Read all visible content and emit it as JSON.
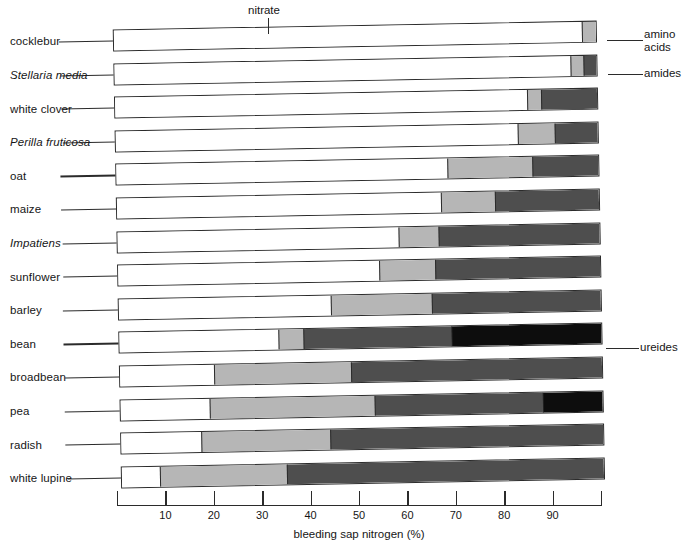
{
  "chart_data": {
    "type": "bar",
    "orientation": "horizontal",
    "stacked": true,
    "title": "",
    "xlabel": "bleeding sap nitrogen (%)",
    "ylabel": "",
    "xlim": [
      0,
      100
    ],
    "xticks": [
      0,
      10,
      20,
      30,
      40,
      50,
      60,
      70,
      80,
      90,
      100
    ],
    "xtick_labels": [
      "",
      "10",
      "20",
      "30",
      "40",
      "50",
      "60",
      "70",
      "80",
      "90",
      ""
    ],
    "grid": false,
    "legend": "callout-annotations",
    "series": [
      {
        "name": "nitrate",
        "color": "#ffffff"
      },
      {
        "name": "amino acids",
        "color": "#b6b6b6"
      },
      {
        "name": "amides",
        "color": "#4e4e4e"
      },
      {
        "name": "ureides",
        "color": "#0d0d0d"
      }
    ],
    "categories": [
      "cocklebur",
      "Stellaria media",
      "white clover",
      "Perilla fruticosa",
      "oat",
      "maize",
      "Impatiens",
      "sunflower",
      "barley",
      "bean",
      "broadbean",
      "pea",
      "radish",
      "white lupine"
    ],
    "values": {
      "nitrate": [
        97.0,
        94.6,
        85.5,
        83.3,
        68.6,
        67.2,
        58.3,
        54.1,
        44.0,
        33.0,
        19.4,
        18.4,
        16.7,
        7.9
      ],
      "amino acids": [
        3.0,
        2.7,
        2.9,
        7.7,
        17.8,
        11.3,
        8.2,
        11.6,
        20.9,
        5.2,
        28.6,
        34.3,
        26.7,
        26.4
      ],
      "amides": [
        0.0,
        2.7,
        11.6,
        9.0,
        13.6,
        21.5,
        33.5,
        34.3,
        35.1,
        30.6,
        52.0,
        34.9,
        56.6,
        65.7
      ],
      "ureides": [
        0.0,
        0.0,
        0.0,
        0.0,
        0.0,
        0.0,
        0.0,
        0.0,
        0.0,
        31.2,
        0.0,
        12.4,
        0.0,
        0.0
      ]
    },
    "rows": [
      {
        "label": "cocklebur",
        "italic": false,
        "segments": [
          97.0,
          3.0,
          0.0,
          0.0
        ]
      },
      {
        "label": "Stellaria media",
        "italic": true,
        "segments": [
          94.6,
          2.7,
          2.7,
          0.0
        ]
      },
      {
        "label": "white clover",
        "italic": false,
        "segments": [
          85.5,
          2.9,
          11.6,
          0.0
        ]
      },
      {
        "label": "Perilla fruticosa",
        "italic": true,
        "segments": [
          83.3,
          7.7,
          9.0,
          0.0
        ]
      },
      {
        "label": "oat",
        "italic": false,
        "segments": [
          68.6,
          17.8,
          13.6,
          0.0
        ]
      },
      {
        "label": "maize",
        "italic": false,
        "segments": [
          67.2,
          11.3,
          21.5,
          0.0
        ]
      },
      {
        "label": "Impatiens",
        "italic": true,
        "segments": [
          58.3,
          8.2,
          33.5,
          0.0
        ]
      },
      {
        "label": "sunflower",
        "italic": false,
        "segments": [
          54.1,
          11.6,
          34.3,
          0.0
        ]
      },
      {
        "label": "barley",
        "italic": false,
        "segments": [
          44.0,
          20.9,
          35.1,
          0.0
        ]
      },
      {
        "label": "bean",
        "italic": false,
        "segments": [
          33.0,
          5.2,
          30.6,
          31.2
        ]
      },
      {
        "label": "broadbean",
        "italic": false,
        "segments": [
          19.4,
          28.6,
          52.0,
          0.0
        ]
      },
      {
        "label": "pea",
        "italic": false,
        "segments": [
          18.4,
          34.3,
          34.9,
          12.4
        ]
      },
      {
        "label": "radish",
        "italic": false,
        "segments": [
          16.7,
          26.7,
          56.6,
          0.0
        ]
      },
      {
        "label": "white lupine",
        "italic": false,
        "segments": [
          7.9,
          26.4,
          65.7,
          0.0
        ]
      }
    ],
    "annotations": [
      {
        "name": "nitrate",
        "text": "nitrate",
        "target_row": 0,
        "position": "top"
      },
      {
        "name": "amino-acids",
        "text": "amino\nacids",
        "target_row": 0,
        "position": "right"
      },
      {
        "name": "amides",
        "text": "amides",
        "target_row": 1,
        "position": "right"
      },
      {
        "name": "ureides",
        "text": "ureides",
        "target_row": 9,
        "position": "right"
      }
    ]
  }
}
